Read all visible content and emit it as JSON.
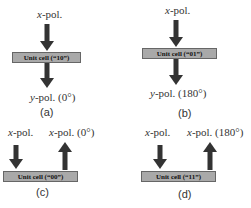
{
  "panels": {
    "a": {
      "caption": "(a)",
      "input_label_var": "x",
      "input_label_rest": "-pol.",
      "unit_cell": "Unit cell (“10”)",
      "output_label_var": "y",
      "output_label_rest": "-pol. (0°)",
      "mode": "transmission"
    },
    "b": {
      "caption": "(b)",
      "input_label_var": "x",
      "input_label_rest": "-pol.",
      "unit_cell": "Unit cell (“01”)",
      "output_label_var": "y",
      "output_label_rest": "-pol. (180°)",
      "mode": "transmission"
    },
    "c": {
      "caption": "(c)",
      "input_label_var": "x",
      "input_label_rest": "-pol.",
      "unit_cell": "Unit cell (“00”)",
      "output_label_var": "x",
      "output_label_rest": "-pol. (0°)",
      "mode": "reflection"
    },
    "d": {
      "caption": "(d)",
      "input_label_var": "x",
      "input_label_rest": "-pol.",
      "unit_cell": "Unit cell (“11”)",
      "output_label_var": "x",
      "output_label_rest": "-pol. (180°)",
      "mode": "reflection"
    }
  },
  "colors": {
    "arrow": "#333333",
    "unit_cell_fill": "#a9a9a9",
    "unit_cell_border": "#666666"
  }
}
